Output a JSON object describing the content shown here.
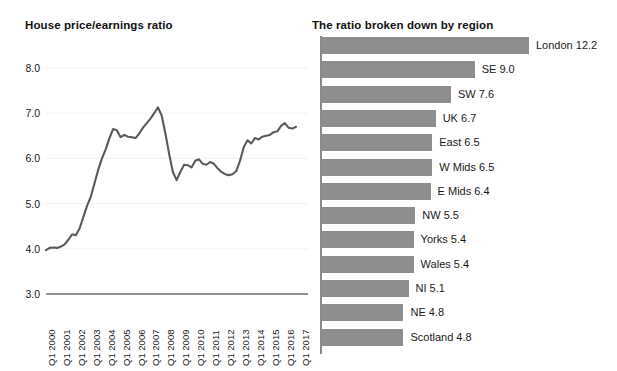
{
  "line_panel": {
    "title": "House price/earnings ratio"
  },
  "bar_panel": {
    "title": "The ratio broken down by region"
  },
  "colors": {
    "line": "#5a5a5a",
    "bar": "#8e8e8e",
    "axis": "#8a8a8a",
    "grid": "#f2f2f2",
    "text": "#1a1a1a"
  },
  "chart_data": [
    {
      "type": "line",
      "title": "House price/earnings ratio",
      "xlabel": "",
      "ylabel": "",
      "ylim": [
        3.0,
        8.0
      ],
      "yticks": [
        "3.0",
        "4.0",
        "5.0",
        "6.0",
        "7.0",
        "8.0"
      ],
      "grid": true,
      "legend": "none",
      "x": [
        "Q1 2000",
        "Q1 2001",
        "Q1 2002",
        "Q1 2003",
        "Q1 2004",
        "Q1 2005",
        "Q1 2006",
        "Q1 2007",
        "Q1 2008",
        "Q1 2009",
        "Q1 2010",
        "Q1 2011",
        "Q1 2012",
        "Q1 2013",
        "Q1 2014",
        "Q1 2015",
        "Q1 2016",
        "Q1 2017"
      ],
      "series": [
        {
          "name": "House price/earnings ratio",
          "values": [
            3.97,
            4.02,
            4.03,
            4.02,
            4.05,
            4.1,
            4.2,
            4.32,
            4.3,
            4.45,
            4.7,
            4.95,
            5.15,
            5.45,
            5.75,
            6.0,
            6.2,
            6.45,
            6.65,
            6.62,
            6.47,
            6.52,
            6.48,
            6.47,
            6.45,
            6.55,
            6.68,
            6.78,
            6.88,
            7.0,
            7.13,
            6.95,
            6.55,
            6.1,
            5.7,
            5.52,
            5.7,
            5.86,
            5.85,
            5.8,
            5.95,
            5.98,
            5.88,
            5.86,
            5.92,
            5.88,
            5.78,
            5.7,
            5.65,
            5.63,
            5.65,
            5.72,
            5.95,
            6.25,
            6.4,
            6.33,
            6.45,
            6.42,
            6.48,
            6.5,
            6.52,
            6.58,
            6.6,
            6.72,
            6.78,
            6.68,
            6.66,
            6.7
          ]
        }
      ]
    },
    {
      "type": "bar",
      "orientation": "horizontal",
      "title": "The ratio broken down by region",
      "xlabel": "",
      "ylabel": "",
      "xlim": [
        0,
        12.2
      ],
      "grid": false,
      "legend": "none",
      "categories": [
        "London",
        "SE",
        "SW",
        "UK",
        "East",
        "W Mids",
        "E Mids",
        "NW",
        "Yorks",
        "Wales",
        "NI",
        "NE",
        "Scotland"
      ],
      "values": [
        12.2,
        9.0,
        7.6,
        6.7,
        6.5,
        6.5,
        6.4,
        5.5,
        5.4,
        5.4,
        5.1,
        4.8,
        4.8
      ],
      "labels": [
        "London 12.2",
        "SE 9.0",
        "SW 7.6",
        "UK 6.7",
        "East 6.5",
        "W Mids 6.5",
        "E Mids 6.4",
        "NW 5.5",
        "Yorks 5.4",
        "Wales 5.4",
        "NI 5.1",
        "NE 4.8",
        "Scotland 4.8"
      ]
    }
  ]
}
